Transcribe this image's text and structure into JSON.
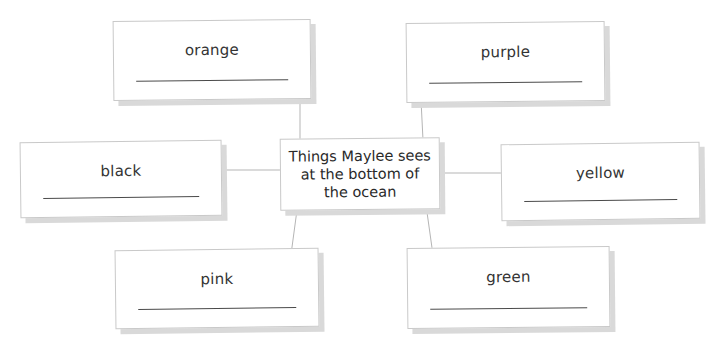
{
  "diagram": {
    "type": "concept-web",
    "center": {
      "text": "Things Maylee sees at the bottom of the ocean"
    },
    "nodes": [
      {
        "id": "orange",
        "label": "orange",
        "answer": ""
      },
      {
        "id": "purple",
        "label": "purple",
        "answer": ""
      },
      {
        "id": "black",
        "label": "black",
        "answer": ""
      },
      {
        "id": "yellow",
        "label": "yellow",
        "answer": ""
      },
      {
        "id": "pink",
        "label": "pink",
        "answer": ""
      },
      {
        "id": "green",
        "label": "green",
        "answer": ""
      }
    ]
  },
  "colors": {
    "background": "#ffffff",
    "card_border": "#c9c9c9",
    "card_shadow": "#d9d9d9",
    "connector": "#b5b5b5",
    "text": "#333333",
    "answer_line": "#4a4a4a"
  }
}
